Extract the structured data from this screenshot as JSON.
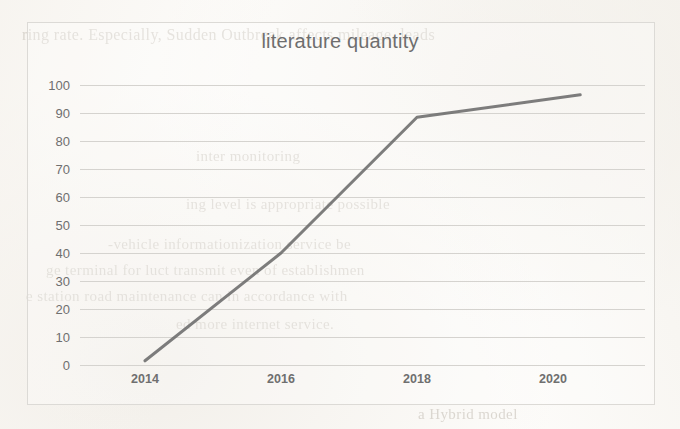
{
  "page": {
    "background_color": "#fdfcfa",
    "bleed_through_text": [
      {
        "text": "ring rate.  Especially, Sudden  Outbreak  affects  mileage, leads",
        "x": 22,
        "y": 26,
        "size": 16
      },
      {
        "text": "inter  monitoring",
        "x": 196,
        "y": 148,
        "size": 15
      },
      {
        "text": "ing  level  is   appropriate  possible",
        "x": 186,
        "y": 196,
        "size": 15
      },
      {
        "text": "-vehicle  informationization   service   be",
        "x": 108,
        "y": 236,
        "size": 15
      },
      {
        "text": "ge  terminal  for   luct  transmit  even  of  establishmen",
        "x": 46,
        "y": 262,
        "size": 15
      },
      {
        "text": "e  station  road  maintenance  can  in  accordance  with",
        "x": 26,
        "y": 288,
        "size": 15
      },
      {
        "text": "ed  more  internet  service.",
        "x": 176,
        "y": 316,
        "size": 15
      },
      {
        "text": "a    Hybrid  model",
        "x": 418,
        "y": 406,
        "size": 15
      }
    ]
  },
  "chart_frame": {
    "border_color": "#dcdad6"
  },
  "chart_data": {
    "type": "line",
    "title": "literature quantity",
    "xlabel": "",
    "ylabel": "",
    "categories": [
      2014,
      2016,
      2018,
      2020
    ],
    "x_tick_labels": [
      "2014",
      "2016",
      "2018",
      "2020"
    ],
    "y_tick_labels": [
      "0",
      "10",
      "20",
      "30",
      "40",
      "50",
      "60",
      "70",
      "80",
      "90",
      "100"
    ],
    "y_ticks": [
      0,
      10,
      20,
      30,
      40,
      50,
      60,
      70,
      80,
      90,
      100
    ],
    "ylim": [
      0,
      100
    ],
    "xlim": [
      2013.6,
      2021.4
    ],
    "grid": true,
    "grid_color": "#d5d3cf",
    "legend": false,
    "series": [
      {
        "name": "literature quantity",
        "color": "#6b6b6b",
        "line_width": 3,
        "x": [
          2014.0,
          2016.0,
          2018.0,
          2020.4
        ],
        "values": [
          1.5,
          40,
          88.5,
          96.5
        ],
        "points": [
          {
            "x": 2014.0,
            "y": 1.5
          },
          {
            "x": 2016.0,
            "y": 40
          },
          {
            "x": 2018.0,
            "y": 88.5
          },
          {
            "x": 2020.4,
            "y": 96.5
          }
        ]
      }
    ]
  }
}
